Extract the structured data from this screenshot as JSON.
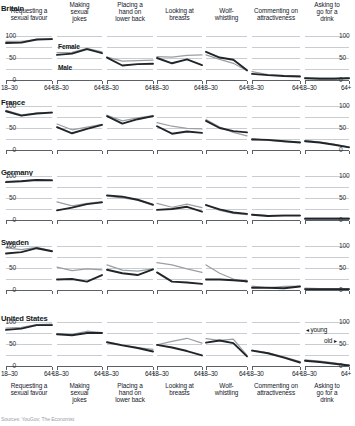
{
  "chart_data": {
    "type": "line",
    "title": "",
    "subtitle": "",
    "xlabel": "",
    "ylabel": "",
    "ylim": [
      0,
      100
    ],
    "yticks": [
      0,
      50,
      100
    ],
    "ytick_labels": [
      "0",
      "50",
      "100"
    ],
    "grid": true,
    "legend_position": "inside-panel-row1-col2",
    "x": [
      "18-30",
      "31-44",
      "45-64",
      "64+"
    ],
    "xtick_labels": [
      "18–30",
      "64+"
    ],
    "categories": [
      "Requesting a sexual favour",
      "Making sexual jokes",
      "Placing a hand on lower back",
      "Looking at breasts",
      "Wolf-whistling",
      "Commenting on attractiveness",
      "Asking to go for a drink"
    ],
    "rows": [
      "Britain",
      "France",
      "Germany",
      "Sweden",
      "United States"
    ],
    "series_names": [
      "Female",
      "Male"
    ],
    "series_colors": {
      "Female": "#9a9fa4",
      "Male": "#1f2529"
    },
    "annotations": [
      "◂ young",
      "old ▸"
    ],
    "panels": [
      {
        "row": "Britain",
        "cells": [
          {
            "category": "Requesting a sexual favour",
            "series": [
              {
                "name": "Female",
                "values": [
                  88,
                  88,
                  92,
                  94
                ]
              },
              {
                "name": "Male",
                "values": [
                  84,
                  85,
                  92,
                  93
                ]
              }
            ]
          },
          {
            "category": "Making sexual jokes",
            "series": [
              {
                "name": "Female",
                "values": [
                  62,
                  63,
                  72,
                  64
                ]
              },
              {
                "name": "Male",
                "values": [
                  57,
                  60,
                  70,
                  61
                ]
              }
            ]
          },
          {
            "category": "Placing a hand on lower back",
            "series": [
              {
                "name": "Female",
                "values": [
                  52,
                  43,
                  44,
                  45
                ]
              },
              {
                "name": "Male",
                "values": [
                  51,
                  33,
                  36,
                  37
                ]
              }
            ]
          },
          {
            "category": "Looking at breasts",
            "series": [
              {
                "name": "Female",
                "values": [
                  53,
                  52,
                  56,
                  57
                ]
              },
              {
                "name": "Male",
                "values": [
                  50,
                  38,
                  47,
                  34
                ]
              }
            ]
          },
          {
            "category": "Wolf-whistling",
            "series": [
              {
                "name": "Female",
                "values": [
                  57,
                  47,
                  38,
                  21
                ]
              },
              {
                "name": "Male",
                "values": [
                  64,
                  51,
                  46,
                  22
                ]
              }
            ]
          },
          {
            "category": "Commenting on attractiveness",
            "series": [
              {
                "name": "Female",
                "values": [
                  19,
                  12,
                  10,
                  9
                ]
              },
              {
                "name": "Male",
                "values": [
                  14,
                  11,
                  9,
                  8
                ]
              }
            ]
          },
          {
            "category": "Asking to go for a drink",
            "series": [
              {
                "name": "Female",
                "values": [
                  5,
                  4,
                  4,
                  5
                ]
              },
              {
                "name": "Male",
                "values": [
                  4,
                  3,
                  3,
                  4
                ]
              }
            ]
          }
        ]
      },
      {
        "row": "France",
        "cells": [
          {
            "category": "Requesting a sexual favour",
            "series": [
              {
                "name": "Female",
                "values": [
                  90,
                  80,
                  84,
                  86
                ]
              },
              {
                "name": "Male",
                "values": [
                  88,
                  78,
                  83,
                  85
                ]
              }
            ]
          },
          {
            "category": "Making sexual jokes",
            "series": [
              {
                "name": "Female",
                "values": [
                  59,
                  46,
                  52,
                  58
                ]
              },
              {
                "name": "Male",
                "values": [
                  52,
                  38,
                  48,
                  57
                ]
              }
            ]
          },
          {
            "category": "Placing a hand on lower back",
            "series": [
              {
                "name": "Female",
                "values": [
                  79,
                  66,
                  73,
                  78
                ]
              },
              {
                "name": "Male",
                "values": [
                  77,
                  60,
                  70,
                  77
                ]
              }
            ]
          },
          {
            "category": "Looking at breasts",
            "series": [
              {
                "name": "Female",
                "values": [
                  62,
                  54,
                  49,
                  48
                ]
              },
              {
                "name": "Male",
                "values": [
                  54,
                  37,
                  42,
                  39
                ]
              }
            ]
          },
          {
            "category": "Wolf-whistling",
            "series": [
              {
                "name": "Female",
                "values": [
                  69,
                  52,
                  40,
                  32
                ]
              },
              {
                "name": "Male",
                "values": [
                  66,
                  50,
                  43,
                  40
                ]
              }
            ]
          },
          {
            "category": "Commenting on attractiveness",
            "series": [
              {
                "name": "Female",
                "values": [
                  26,
                  22,
                  19,
                  18
                ]
              },
              {
                "name": "Male",
                "values": [
                  24,
                  23,
                  20,
                  17
                ]
              }
            ]
          },
          {
            "category": "Asking to go for a drink",
            "series": [
              {
                "name": "Female",
                "values": [
                  22,
                  18,
                  13,
                  7
                ]
              },
              {
                "name": "Male",
                "values": [
                  20,
                  17,
                  12,
                  6
                ]
              }
            ]
          }
        ]
      },
      {
        "row": "Germany",
        "cells": [
          {
            "category": "Requesting a sexual favour",
            "series": [
              {
                "name": "Female",
                "values": [
                  88,
                  89,
                  92,
                  92
                ]
              },
              {
                "name": "Male",
                "values": [
                  86,
                  88,
                  91,
                  90
                ]
              }
            ]
          },
          {
            "category": "Making sexual jokes",
            "series": [
              {
                "name": "Female",
                "values": [
                  41,
                  32,
                  38,
                  42
                ]
              },
              {
                "name": "Male",
                "values": [
                  22,
                  28,
                  36,
                  40
                ]
              }
            ]
          },
          {
            "category": "Placing a hand on lower back",
            "series": [
              {
                "name": "Female",
                "values": [
                  54,
                  50,
                  45,
                  33
                ]
              },
              {
                "name": "Male",
                "values": [
                  56,
                  53,
                  46,
                  35
                ]
              }
            ]
          },
          {
            "category": "Looking at breasts",
            "series": [
              {
                "name": "Female",
                "values": [
                  38,
                  29,
                  36,
                  28
                ]
              },
              {
                "name": "Male",
                "values": [
                  23,
                  25,
                  30,
                  19
                ]
              }
            ]
          },
          {
            "category": "Wolf-whistling",
            "series": [
              {
                "name": "Female",
                "values": [
                  35,
                  22,
                  15,
                  12
                ]
              },
              {
                "name": "Male",
                "values": [
                  34,
                  24,
                  17,
                  14
                ]
              }
            ]
          },
          {
            "category": "Commenting on attractiveness",
            "series": [
              {
                "name": "Female",
                "values": [
                  13,
                  10,
                  11,
                  11
                ]
              },
              {
                "name": "Male",
                "values": [
                  12,
                  9,
                  10,
                  10
                ]
              }
            ]
          },
          {
            "category": "Asking to go for a drink",
            "series": [
              {
                "name": "Female",
                "values": [
                  4,
                  4,
                  4,
                  4
                ]
              },
              {
                "name": "Male",
                "values": [
                  3,
                  3,
                  3,
                  3
                ]
              }
            ]
          }
        ]
      },
      {
        "row": "Sweden",
        "cells": [
          {
            "category": "Requesting a sexual favour",
            "series": [
              {
                "name": "Female",
                "values": [
                  96,
                  92,
                  97,
                  89
                ]
              },
              {
                "name": "Male",
                "values": [
                  83,
                  86,
                  95,
                  88
                ]
              }
            ]
          },
          {
            "category": "Making sexual jokes",
            "series": [
              {
                "name": "Female",
                "values": [
                  52,
                  44,
                  48,
                  46
                ]
              },
              {
                "name": "Male",
                "values": [
                  24,
                  25,
                  19,
                  34
                ]
              }
            ]
          },
          {
            "category": "Placing a hand on lower back",
            "series": [
              {
                "name": "Female",
                "values": [
                  57,
                  45,
                  43,
                  48
                ]
              },
              {
                "name": "Male",
                "values": [
                  46,
                  38,
                  34,
                  47
                ]
              }
            ]
          },
          {
            "category": "Looking at breasts",
            "series": [
              {
                "name": "Female",
                "values": [
                  62,
                  57,
                  48,
                  40
                ]
              },
              {
                "name": "Male",
                "values": [
                  40,
                  19,
                  17,
                  14
                ]
              }
            ]
          },
          {
            "category": "Wolf-whistling",
            "series": [
              {
                "name": "Female",
                "values": [
                  57,
                  38,
                  25,
                  18
                ]
              },
              {
                "name": "Male",
                "values": [
                  24,
                  24,
                  22,
                  20
                ]
              }
            ]
          },
          {
            "category": "Commenting on attractiveness",
            "series": [
              {
                "name": "Female",
                "values": [
                  9,
                  5,
                  8,
                  9
                ]
              },
              {
                "name": "Male",
                "values": [
                  5,
                  5,
                  4,
                  8
                ]
              }
            ]
          },
          {
            "category": "Asking to go for a drink",
            "series": [
              {
                "name": "Female",
                "values": [
                  4,
                  3,
                  3,
                  3
                ]
              },
              {
                "name": "Male",
                "values": [
                  2,
                  2,
                  2,
                  2
                ]
              }
            ]
          }
        ]
      },
      {
        "row": "United States",
        "cells": [
          {
            "category": "Requesting a sexual favour",
            "series": [
              {
                "name": "Female",
                "values": [
                  86,
                  88,
                  94,
                  95
                ]
              },
              {
                "name": "Male",
                "values": [
                  82,
                  85,
                  93,
                  93
                ]
              }
            ]
          },
          {
            "category": "Making sexual jokes",
            "series": [
              {
                "name": "Female",
                "values": [
                  73,
                  72,
                  79,
                  76
                ]
              },
              {
                "name": "Male",
                "values": [
                  72,
                  70,
                  75,
                  75
                ]
              }
            ]
          },
          {
            "category": "Placing a hand on lower back",
            "series": [
              {
                "name": "Female",
                "values": [
                  54,
                  48,
                  42,
                  38
                ]
              },
              {
                "name": "Male",
                "values": [
                  54,
                  47,
                  41,
                  33
                ]
              }
            ]
          },
          {
            "category": "Looking at breasts",
            "series": [
              {
                "name": "Female",
                "values": [
                  48,
                  56,
                  63,
                  52
                ]
              },
              {
                "name": "Male",
                "values": [
                  48,
                  42,
                  34,
                  24
                ]
              }
            ]
          },
          {
            "category": "Wolf-whistling",
            "series": [
              {
                "name": "Female",
                "values": [
                  62,
                  58,
                  61,
                  24
                ]
              },
              {
                "name": "Male",
                "values": [
                  53,
                  58,
                  52,
                  22
                ]
              }
            ]
          },
          {
            "category": "Commenting on attractiveness",
            "series": [
              {
                "name": "Female",
                "values": [
                  36,
                  30,
                  21,
                  10
                ]
              },
              {
                "name": "Male",
                "values": [
                  35,
                  29,
                  19,
                  8
                ]
              }
            ]
          },
          {
            "category": "Asking to go for a drink",
            "series": [
              {
                "name": "Female",
                "values": [
                  14,
                  11,
                  7,
                  2
                ]
              },
              {
                "name": "Male",
                "values": [
                  12,
                  9,
                  5,
                  1
                ]
              }
            ]
          }
        ]
      }
    ]
  },
  "legend": {
    "female_label": "Female",
    "male_label": "Male"
  },
  "annotation": {
    "young": "◂ young",
    "old": "old ▸"
  },
  "source": "Sources: YouGov; The Economist"
}
